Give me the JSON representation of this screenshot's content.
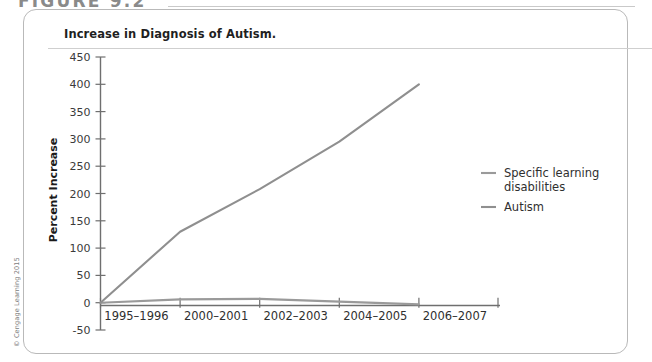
{
  "figure": {
    "number_label": "FIGURE 9.2",
    "caption": "Increase in Diagnosis of Autism.",
    "copyright": "© Cengage Learning 2015"
  },
  "chart_data": {
    "type": "line",
    "title": "Increase in Diagnosis of Autism.",
    "xlabel": "",
    "ylabel": "Percent Increase",
    "categories": [
      "1995–1996",
      "2000–2001",
      "2002–2003",
      "2004–2005",
      "2006–2007"
    ],
    "ylim": [
      -50,
      450
    ],
    "yticks": [
      -50,
      0,
      50,
      100,
      150,
      200,
      250,
      300,
      350,
      400,
      450
    ],
    "ytick_labels": [
      "-50",
      "0",
      "50",
      "100",
      "150",
      "200",
      "250",
      "300",
      "350",
      "400",
      "450"
    ],
    "grid": false,
    "legend_position": "right",
    "series": [
      {
        "name": "Specific learning disabilities",
        "color": "#9a9a9a",
        "values": [
          0,
          6,
          7,
          2,
          -3
        ]
      },
      {
        "name": "Autism",
        "color": "#8f8f8f",
        "values": [
          0,
          130,
          208,
          295,
          400
        ]
      }
    ]
  },
  "legend": {
    "items": [
      {
        "label_line1": "Specific learning",
        "label_line2": "disabilities"
      },
      {
        "label_line1": "Autism",
        "label_line2": ""
      }
    ]
  }
}
